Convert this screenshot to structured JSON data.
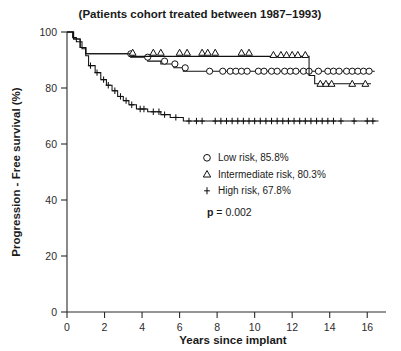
{
  "chart_data": {
    "type": "line",
    "title": "(Patients cohort treated between 1987–1993)",
    "xlabel": "Years since implant",
    "ylabel": "Progression - Free survival (%)",
    "xlim": [
      0,
      17
    ],
    "ylim": [
      0,
      100
    ],
    "xticks": [
      0,
      2,
      4,
      6,
      8,
      10,
      12,
      14,
      16
    ],
    "xticklabels": [
      "0",
      "2",
      "4",
      "6",
      "8",
      "10",
      "12",
      "14",
      "16"
    ],
    "yticks": [
      0,
      20,
      40,
      60,
      80,
      100
    ],
    "yticklabels": [
      "0",
      "20",
      "40",
      "60",
      "80",
      "100"
    ],
    "grid": false,
    "legend_position": "center-right",
    "annotations": [
      {
        "name": "p-value",
        "bold_prefix": "p",
        "rest": " = 0.002"
      }
    ],
    "series": [
      {
        "name": "Low risk",
        "legend_label": "Low risk, 85.8%",
        "marker": "circle-open",
        "final_value": 85.8,
        "points": [
          [
            0.0,
            100.0
          ],
          [
            0.35,
            100.0
          ],
          [
            0.35,
            97.5
          ],
          [
            0.7,
            97.5
          ],
          [
            0.7,
            94.5
          ],
          [
            1.0,
            94.5
          ],
          [
            1.0,
            92.2
          ],
          [
            3.4,
            92.2
          ],
          [
            3.4,
            91.0
          ],
          [
            4.3,
            91.0
          ],
          [
            4.3,
            89.6
          ],
          [
            5.0,
            89.6
          ],
          [
            5.0,
            88.6
          ],
          [
            5.7,
            88.6
          ],
          [
            5.7,
            87.2
          ],
          [
            6.2,
            87.2
          ],
          [
            6.2,
            86.0
          ],
          [
            16.4,
            86.0
          ]
        ],
        "marker_points": [
          [
            3.4,
            92.2
          ],
          [
            4.3,
            91.0
          ],
          [
            5.2,
            89.6
          ],
          [
            5.75,
            88.6
          ],
          [
            6.3,
            87.2
          ],
          [
            7.6,
            86.0
          ],
          [
            8.3,
            86.0
          ],
          [
            8.7,
            86.0
          ],
          [
            9.0,
            86.0
          ],
          [
            9.3,
            86.0
          ],
          [
            9.6,
            86.0
          ],
          [
            10.2,
            86.0
          ],
          [
            10.5,
            86.0
          ],
          [
            10.9,
            86.0
          ],
          [
            11.2,
            86.0
          ],
          [
            11.6,
            86.0
          ],
          [
            11.9,
            86.0
          ],
          [
            12.2,
            86.0
          ],
          [
            12.6,
            86.0
          ],
          [
            12.9,
            86.0
          ],
          [
            13.4,
            86.0
          ],
          [
            13.9,
            86.0
          ],
          [
            14.2,
            86.0
          ],
          [
            14.5,
            86.0
          ],
          [
            14.9,
            86.0
          ],
          [
            15.2,
            86.0
          ],
          [
            15.5,
            86.0
          ],
          [
            15.8,
            86.0
          ],
          [
            16.1,
            86.0
          ]
        ]
      },
      {
        "name": "Intermediate risk",
        "legend_label": "Intermediate risk, 80.3%",
        "marker": "triangle-open",
        "final_value": 80.3,
        "points": [
          [
            0.0,
            100.0
          ],
          [
            0.35,
            100.0
          ],
          [
            0.35,
            97.5
          ],
          [
            0.7,
            97.5
          ],
          [
            0.7,
            94.5
          ],
          [
            1.0,
            94.5
          ],
          [
            1.0,
            92.2
          ],
          [
            3.4,
            92.2
          ],
          [
            3.4,
            91.3
          ],
          [
            12.9,
            91.3
          ],
          [
            12.9,
            84.5
          ],
          [
            13.2,
            84.5
          ],
          [
            13.2,
            81.5
          ],
          [
            16.2,
            81.5
          ]
        ],
        "marker_points": [
          [
            3.5,
            92.6
          ],
          [
            4.6,
            92.6
          ],
          [
            5.0,
            92.6
          ],
          [
            6.0,
            92.6
          ],
          [
            6.4,
            92.6
          ],
          [
            7.2,
            92.6
          ],
          [
            7.5,
            92.6
          ],
          [
            7.9,
            92.6
          ],
          [
            9.3,
            92.6
          ],
          [
            9.7,
            92.6
          ],
          [
            11.0,
            91.8
          ],
          [
            11.4,
            91.8
          ],
          [
            11.7,
            91.8
          ],
          [
            12.0,
            91.8
          ],
          [
            12.3,
            91.8
          ],
          [
            12.7,
            91.8
          ],
          [
            13.5,
            81.5
          ],
          [
            13.8,
            81.5
          ],
          [
            14.1,
            81.5
          ],
          [
            15.2,
            81.5
          ],
          [
            15.9,
            81.5
          ]
        ]
      },
      {
        "name": "High risk",
        "legend_label": "High risk, 67.8%",
        "marker": "plus",
        "final_value": 67.8,
        "points": [
          [
            0.0,
            100.0
          ],
          [
            0.3,
            100.0
          ],
          [
            0.3,
            98.0
          ],
          [
            0.5,
            98.0
          ],
          [
            0.5,
            96.5
          ],
          [
            0.8,
            96.5
          ],
          [
            0.8,
            94.0
          ],
          [
            1.0,
            94.0
          ],
          [
            1.0,
            91.5
          ],
          [
            1.15,
            91.5
          ],
          [
            1.15,
            88.0
          ],
          [
            1.5,
            88.0
          ],
          [
            1.5,
            85.5
          ],
          [
            1.8,
            85.5
          ],
          [
            1.8,
            83.0
          ],
          [
            2.1,
            83.0
          ],
          [
            2.1,
            81.0
          ],
          [
            2.4,
            81.0
          ],
          [
            2.4,
            79.0
          ],
          [
            2.7,
            79.0
          ],
          [
            2.7,
            77.0
          ],
          [
            3.0,
            77.0
          ],
          [
            3.0,
            75.5
          ],
          [
            3.3,
            75.5
          ],
          [
            3.3,
            74.0
          ],
          [
            3.7,
            74.0
          ],
          [
            3.7,
            72.5
          ],
          [
            4.3,
            72.5
          ],
          [
            4.3,
            71.5
          ],
          [
            5.0,
            71.5
          ],
          [
            5.0,
            70.5
          ],
          [
            5.5,
            70.5
          ],
          [
            5.5,
            69.5
          ],
          [
            6.2,
            69.5
          ],
          [
            6.2,
            68.2
          ],
          [
            16.6,
            68.2
          ]
        ],
        "marker_points": [
          [
            1.25,
            88.0
          ],
          [
            1.6,
            85.5
          ],
          [
            1.95,
            83.0
          ],
          [
            2.2,
            81.0
          ],
          [
            2.55,
            79.0
          ],
          [
            2.85,
            77.0
          ],
          [
            3.15,
            75.5
          ],
          [
            3.45,
            74.0
          ],
          [
            3.9,
            72.5
          ],
          [
            4.1,
            72.5
          ],
          [
            4.6,
            71.5
          ],
          [
            4.9,
            71.5
          ],
          [
            5.2,
            70.5
          ],
          [
            5.8,
            69.5
          ],
          [
            6.5,
            68.2
          ],
          [
            6.9,
            68.2
          ],
          [
            7.2,
            68.2
          ],
          [
            7.9,
            68.2
          ],
          [
            8.2,
            68.2
          ],
          [
            8.5,
            68.2
          ],
          [
            8.8,
            68.2
          ],
          [
            9.1,
            68.2
          ],
          [
            9.4,
            68.2
          ],
          [
            9.7,
            68.2
          ],
          [
            10.0,
            68.2
          ],
          [
            10.3,
            68.2
          ],
          [
            10.6,
            68.2
          ],
          [
            10.9,
            68.2
          ],
          [
            11.2,
            68.2
          ],
          [
            11.5,
            68.2
          ],
          [
            11.8,
            68.2
          ],
          [
            12.1,
            68.2
          ],
          [
            12.4,
            68.2
          ],
          [
            12.7,
            68.2
          ],
          [
            13.0,
            68.2
          ],
          [
            13.3,
            68.2
          ],
          [
            13.6,
            68.2
          ],
          [
            13.9,
            68.2
          ],
          [
            14.2,
            68.2
          ],
          [
            14.6,
            68.2
          ],
          [
            15.3,
            68.2
          ],
          [
            16.0,
            68.2
          ],
          [
            16.3,
            68.2
          ]
        ]
      }
    ],
    "legend_entries": [
      {
        "marker": "circle-open",
        "label": "Low risk, 85.8%"
      },
      {
        "marker": "triangle-open",
        "label": "Intermediate risk, 80.3%"
      },
      {
        "marker": "plus",
        "label": "High risk, 67.8%"
      }
    ],
    "colors": {
      "line": "#111111",
      "axis": "#2b2b2b",
      "text": "#1a1a1a",
      "background": "#ffffff"
    }
  }
}
